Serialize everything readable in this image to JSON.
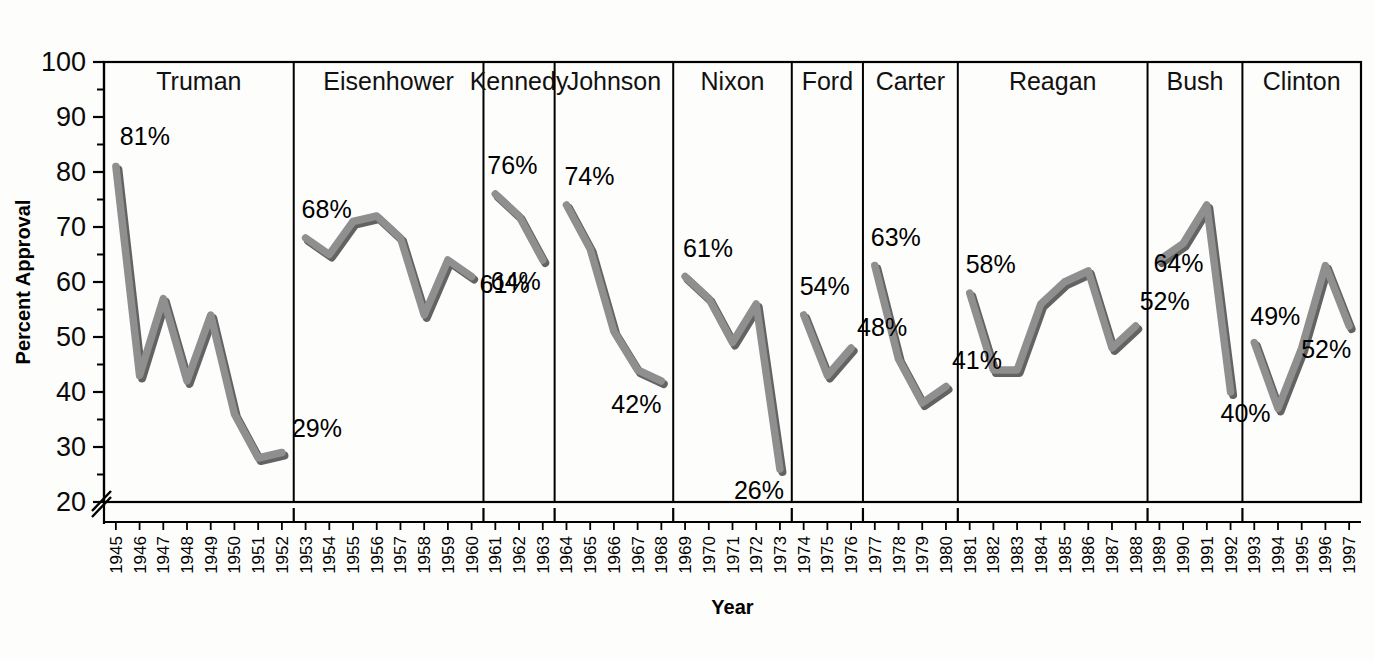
{
  "chart_data": {
    "type": "line",
    "title": "",
    "xlabel": "Year",
    "ylabel": "Percent Approval",
    "ylim": [
      20,
      100
    ],
    "yticks": [
      20,
      30,
      40,
      50,
      60,
      70,
      80,
      90,
      100
    ],
    "ytick_labels": [
      "20",
      "30",
      "40",
      "50",
      "60",
      "70",
      "80",
      "90",
      "100"
    ],
    "y_axis_break": true,
    "y_axis_break_at": 20,
    "minor_ticks": true,
    "grid": false,
    "legend": "none",
    "panel_layout": "faceted-by-president",
    "line_color": "#8f8f8f",
    "line_shadow_color": "#636363",
    "panels": [
      {
        "name": "Truman",
        "x": [
          1945,
          1946,
          1947,
          1948,
          1949,
          1950,
          1951,
          1952
        ],
        "values": [
          81,
          43,
          57,
          42,
          54,
          36,
          28,
          29
        ],
        "annotations": [
          {
            "label": "81%",
            "year": 1945,
            "value": 81
          },
          {
            "label": "29%",
            "year": 1952,
            "value": 29
          }
        ]
      },
      {
        "name": "Eisenhower",
        "x": [
          1953,
          1954,
          1955,
          1956,
          1957,
          1958,
          1959,
          1960
        ],
        "values": [
          68,
          65,
          71,
          72,
          68,
          54,
          64,
          61
        ],
        "annotations": [
          {
            "label": "68%",
            "year": 1953,
            "value": 68
          },
          {
            "label": "61%",
            "year": 1960,
            "value": 61
          }
        ]
      },
      {
        "name": "Kennedy",
        "x": [
          1961,
          1962,
          1963
        ],
        "values": [
          76,
          72,
          64
        ],
        "annotations": [
          {
            "label": "76%",
            "year": 1961,
            "value": 76
          },
          {
            "label": "64%",
            "year": 1963,
            "value": 64
          }
        ]
      },
      {
        "name": "Johnson",
        "x": [
          1964,
          1965,
          1966,
          1967,
          1968
        ],
        "values": [
          74,
          66,
          51,
          44,
          42
        ],
        "annotations": [
          {
            "label": "74%",
            "year": 1964,
            "value": 74
          },
          {
            "label": "42%",
            "year": 1968,
            "value": 42
          }
        ]
      },
      {
        "name": "Nixon",
        "x": [
          1969,
          1970,
          1971,
          1972,
          1973
        ],
        "values": [
          61,
          57,
          49,
          56,
          26
        ],
        "annotations": [
          {
            "label": "61%",
            "year": 1969,
            "value": 61
          },
          {
            "label": "26%",
            "year": 1973,
            "value": 26
          }
        ]
      },
      {
        "name": "Ford",
        "x": [
          1974,
          1975,
          1976
        ],
        "values": [
          54,
          43,
          48
        ],
        "annotations": [
          {
            "label": "54%",
            "year": 1974,
            "value": 54
          },
          {
            "label": "48%",
            "year": 1976,
            "value": 48
          }
        ]
      },
      {
        "name": "Carter",
        "x": [
          1977,
          1978,
          1979,
          1980
        ],
        "values": [
          63,
          46,
          38,
          41
        ],
        "annotations": [
          {
            "label": "63%",
            "year": 1977,
            "value": 63
          },
          {
            "label": "41%",
            "year": 1980,
            "value": 41
          }
        ]
      },
      {
        "name": "Reagan",
        "x": [
          1981,
          1982,
          1983,
          1984,
          1985,
          1986,
          1987,
          1988
        ],
        "values": [
          58,
          44,
          44,
          56,
          60,
          62,
          48,
          52
        ],
        "annotations": [
          {
            "label": "58%",
            "year": 1981,
            "value": 58
          },
          {
            "label": "52%",
            "year": 1988,
            "value": 52
          }
        ]
      },
      {
        "name": "Bush",
        "x": [
          1989,
          1990,
          1991,
          1992
        ],
        "values": [
          64,
          67,
          74,
          40
        ],
        "annotations": [
          {
            "label": "64%",
            "year": 1989,
            "value": 64
          },
          {
            "label": "40%",
            "year": 1992,
            "value": 40
          }
        ]
      },
      {
        "name": "Clinton",
        "x": [
          1993,
          1994,
          1995,
          1996,
          1997
        ],
        "values": [
          49,
          37,
          48,
          63,
          52
        ],
        "annotations": [
          {
            "label": "49%",
            "year": 1993,
            "value": 49
          },
          {
            "label": "52%",
            "year": 1997,
            "value": 52
          }
        ]
      }
    ]
  }
}
